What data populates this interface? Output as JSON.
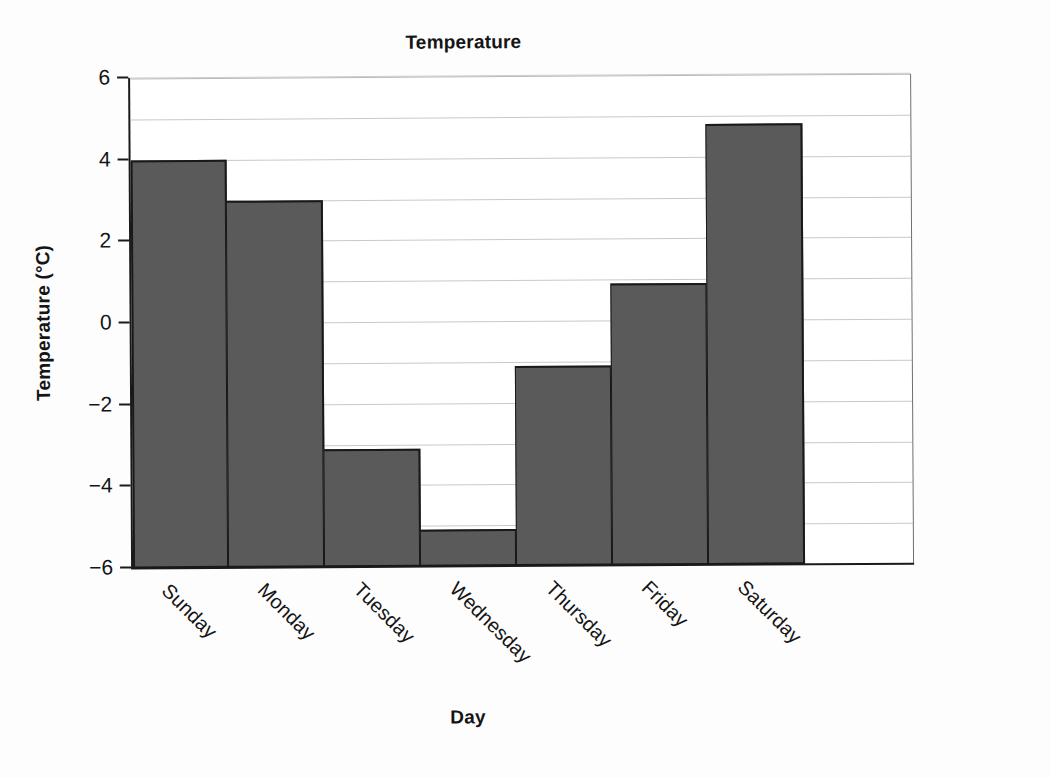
{
  "chart_data": {
    "type": "bar",
    "title": "Temperature",
    "xlabel": "Day",
    "ylabel": "Temperature (°C)",
    "categories": [
      "Sunday",
      "Monday",
      "Tuesday",
      "Wednesday",
      "Thursday",
      "Friday",
      "Saturday"
    ],
    "values": [
      4.0,
      3.0,
      -3.1,
      -5.1,
      -1.1,
      0.9,
      4.8
    ],
    "ylim": [
      -6,
      6
    ],
    "ytick_values": [
      6,
      4,
      2,
      0,
      -2,
      -4,
      -6
    ],
    "ytick_labels": [
      "6",
      "4",
      "2",
      "0",
      "−2",
      "−4",
      "−6"
    ],
    "gridline_values": [
      6,
      5,
      4,
      3,
      2,
      1,
      0,
      -1,
      -2,
      -3,
      -4,
      -5
    ],
    "grid": true,
    "legend": false,
    "bar_color": "#5a5a5a",
    "bar_edge_color": "#191919",
    "grid_color": "#c9c9c9",
    "axis_color": "#1a1a1a",
    "background_color": "#ffffff",
    "xlabel_rotation": 45
  }
}
